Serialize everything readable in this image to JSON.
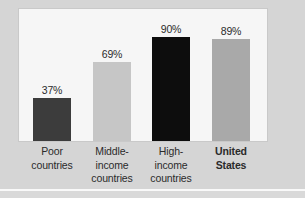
{
  "chart_data": {
    "type": "bar",
    "title": "",
    "subtitle": "",
    "xlabel": "",
    "ylabel": "",
    "ylim": [
      0,
      100
    ],
    "grid": false,
    "legend": null,
    "categories": [
      "Poor countries",
      "Middle-income countries",
      "High-income countries",
      "United States"
    ],
    "values": [
      37,
      69,
      90,
      89
    ],
    "value_labels": [
      "37%",
      "69%",
      "90%",
      "89%"
    ],
    "bars": [
      {
        "label_lines": [
          "Poor",
          "countries"
        ],
        "value": 37,
        "value_label": "37%",
        "color": "#3c3c3c",
        "bold_label": false
      },
      {
        "label_lines": [
          "Middle-",
          "income",
          "countries"
        ],
        "value": 69,
        "value_label": "69%",
        "color": "#c6c6c6",
        "bold_label": false
      },
      {
        "label_lines": [
          "High-",
          "income",
          "countries"
        ],
        "value": 90,
        "value_label": "90%",
        "color": "#0d0d0d",
        "bold_label": false
      },
      {
        "label_lines": [
          "United",
          "States"
        ],
        "value": 89,
        "value_label": "89%",
        "color": "#a9a9a9",
        "bold_label": true
      }
    ]
  },
  "colors": {
    "figure_background": "#d5d5d5",
    "plot_background": "#f6f6f6",
    "plot_border": "#c9c9c9",
    "label_text": "#2b2b2b",
    "divider": "#ffffff"
  }
}
